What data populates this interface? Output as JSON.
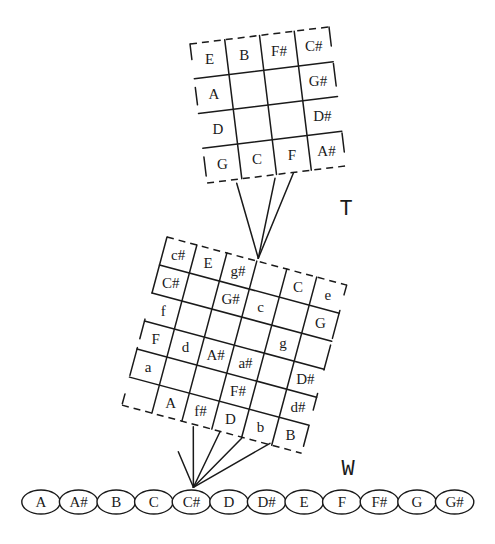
{
  "figure": {
    "t_label": "T",
    "w_label": "W"
  },
  "grid_t": {
    "rows": 4,
    "cols": 4,
    "cells": [
      {
        "row": 0,
        "col": 0,
        "note": "E"
      },
      {
        "row": 0,
        "col": 1,
        "note": "B"
      },
      {
        "row": 0,
        "col": 2,
        "note": "F#"
      },
      {
        "row": 0,
        "col": 3,
        "note": "C#"
      },
      {
        "row": 1,
        "col": 0,
        "note": "A"
      },
      {
        "row": 1,
        "col": 3,
        "note": "G#"
      },
      {
        "row": 2,
        "col": 0,
        "note": "D"
      },
      {
        "row": 2,
        "col": 3,
        "note": "D#"
      },
      {
        "row": 3,
        "col": 0,
        "note": "G"
      },
      {
        "row": 3,
        "col": 1,
        "note": "C"
      },
      {
        "row": 3,
        "col": 2,
        "note": "F"
      },
      {
        "row": 3,
        "col": 3,
        "note": "A#"
      }
    ]
  },
  "grid_w": {
    "rows": 6,
    "cols": 6,
    "cells": [
      {
        "row": 0,
        "col": 0,
        "note": "c#"
      },
      {
        "row": 0,
        "col": 1,
        "note": "E"
      },
      {
        "row": 0,
        "col": 2,
        "note": "g#"
      },
      {
        "row": 0,
        "col": 4,
        "note": "C"
      },
      {
        "row": 0,
        "col": 5,
        "note": "e"
      },
      {
        "row": 1,
        "col": 0,
        "note": "C#"
      },
      {
        "row": 1,
        "col": 2,
        "note": "G#"
      },
      {
        "row": 1,
        "col": 3,
        "note": "c"
      },
      {
        "row": 1,
        "col": 5,
        "note": "G"
      },
      {
        "row": 2,
        "col": 0,
        "note": "f"
      },
      {
        "row": 2,
        "col": 4,
        "note": "g"
      },
      {
        "row": 3,
        "col": 0,
        "note": "F"
      },
      {
        "row": 3,
        "col": 1,
        "note": "d"
      },
      {
        "row": 3,
        "col": 2,
        "note": "A#"
      },
      {
        "row": 3,
        "col": 3,
        "note": "a#"
      },
      {
        "row": 3,
        "col": 5,
        "note": "D#"
      },
      {
        "row": 4,
        "col": 0,
        "note": "a"
      },
      {
        "row": 4,
        "col": 3,
        "note": "F#"
      },
      {
        "row": 4,
        "col": 5,
        "note": "d#"
      },
      {
        "row": 5,
        "col": 1,
        "note": "A"
      },
      {
        "row": 5,
        "col": 2,
        "note": "f#"
      },
      {
        "row": 5,
        "col": 3,
        "note": "D"
      },
      {
        "row": 5,
        "col": 4,
        "note": "b"
      },
      {
        "row": 5,
        "col": 5,
        "note": "B"
      }
    ]
  },
  "chromatic_scale": {
    "notes": [
      "A",
      "A#",
      "B",
      "C",
      "C#",
      "D",
      "D#",
      "E",
      "F",
      "F#",
      "G",
      "G#"
    ],
    "anchor_note": "C#"
  },
  "colors": {
    "ink": "#1a1a1a",
    "background": "#ffffff"
  }
}
